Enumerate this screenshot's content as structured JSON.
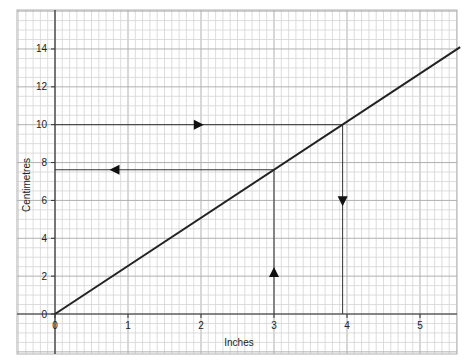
{
  "chart_data": {
    "type": "line",
    "title": "",
    "xlabel": "Inches",
    "ylabel": "Centimetres",
    "xlim": [
      0,
      5.55
    ],
    "ylim": [
      0,
      14.1
    ],
    "x_ticks": [
      "0",
      "1",
      "2",
      "3",
      "4",
      "5"
    ],
    "y_ticks": [
      "0",
      "2",
      "4",
      "6",
      "8",
      "10",
      "12",
      "14"
    ],
    "grid": true,
    "series": [
      {
        "name": "Conversion line",
        "x": [
          0,
          5.55
        ],
        "y": [
          0,
          14.1
        ]
      }
    ],
    "annotations": [
      {
        "type": "guide",
        "description": "10 cm → inches",
        "path": [
          [
            0,
            10
          ],
          [
            3.94,
            10
          ],
          [
            3.94,
            0
          ]
        ],
        "arrows": [
          "right",
          "down"
        ]
      },
      {
        "type": "guide",
        "description": "3 inches → cm",
        "path": [
          [
            3,
            0
          ],
          [
            3,
            7.62
          ],
          [
            0,
            7.62
          ]
        ],
        "arrows": [
          "up",
          "left"
        ]
      }
    ]
  },
  "axes": {
    "x_label": "Inches",
    "y_label": "Centimetres",
    "x_tick_labels": [
      "0",
      "1",
      "2",
      "3",
      "4",
      "5"
    ],
    "y_tick_labels": [
      "0",
      "2",
      "4",
      "6",
      "8",
      "10",
      "12",
      "14"
    ]
  },
  "colors": {
    "line": "#222222",
    "grid_minor": "#d4d4d4",
    "grid_major": "#b0b0b0",
    "background": "#ffffff"
  }
}
